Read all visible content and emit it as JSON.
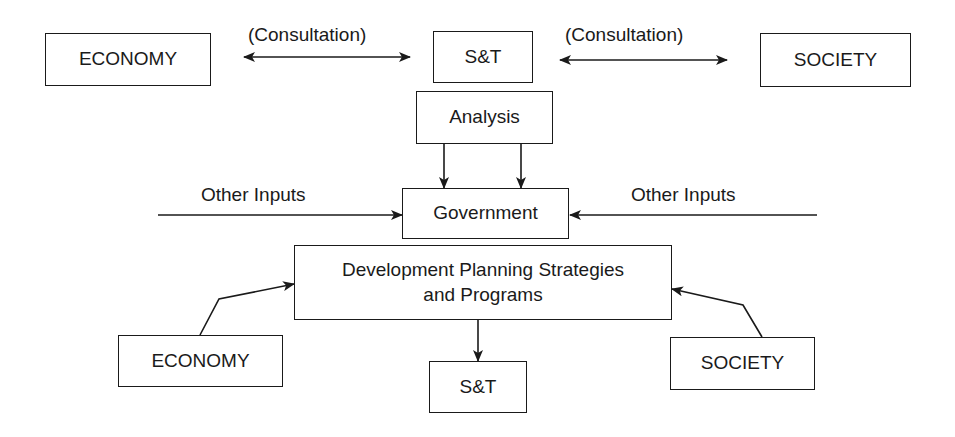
{
  "top_row": {
    "economy": "ECONOMY",
    "st": "S&T",
    "society": "SOCIETY",
    "left_link_label": "(Consultation)",
    "right_link_label": "(Consultation)"
  },
  "analysis": "Analysis",
  "government": "Government",
  "other_inputs_left": "Other Inputs",
  "other_inputs_right": "Other Inputs",
  "planning": {
    "line1": "Development Planning Strategies",
    "line2": "and Programs"
  },
  "bottom_row": {
    "economy": "ECONOMY",
    "st": "S&T",
    "society": "SOCIETY"
  },
  "colors": {
    "stroke": "#1a1a1a",
    "background": "#ffffff"
  }
}
